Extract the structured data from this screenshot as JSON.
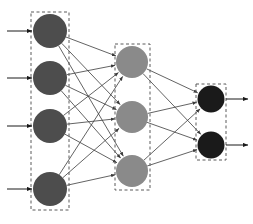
{
  "diagram": {
    "type": "neural-network",
    "canvas": {
      "width": 253,
      "height": 224,
      "background": "#ffffff"
    },
    "edge_color": "#3b3b3b",
    "edge_width": 0.8,
    "arrow_color": "#1a1a1a",
    "group_box_style": {
      "stroke": "#5a5a5a",
      "stroke_width": 1,
      "dash": "3,2.5",
      "fill": "none"
    },
    "node_stroke": "none",
    "layers": [
      {
        "id": "input-layer",
        "name": "Input Layer",
        "node_count": 4,
        "node_color": "#4d4d4d",
        "node_radius": 17,
        "center_x": 50,
        "box": {
          "x": 31,
          "y": 12,
          "width": 38,
          "height": 198
        },
        "nodes": [
          {
            "id": "input-node-1",
            "cx": 50,
            "cy": 31
          },
          {
            "id": "input-node-2",
            "cx": 50,
            "cy": 78
          },
          {
            "id": "input-node-3",
            "cx": 50,
            "cy": 126
          },
          {
            "id": "input-node-4",
            "cx": 50,
            "cy": 189
          }
        ],
        "io_arrows": [
          {
            "id": "input-arrow-1",
            "x1": 7,
            "y1": 31,
            "x2": 32,
            "y2": 31
          },
          {
            "id": "input-arrow-2",
            "x1": 7,
            "y1": 78,
            "x2": 32,
            "y2": 78
          },
          {
            "id": "input-arrow-3",
            "x1": 7,
            "y1": 126,
            "x2": 32,
            "y2": 126
          },
          {
            "id": "input-arrow-4",
            "x1": 7,
            "y1": 189,
            "x2": 32,
            "y2": 189
          }
        ]
      },
      {
        "id": "hidden-layer",
        "name": "Hidden Layer",
        "node_count": 3,
        "node_color": "#8a8a8a",
        "node_radius": 16,
        "center_x": 132,
        "box": {
          "x": 115,
          "y": 44,
          "width": 35,
          "height": 146
        },
        "nodes": [
          {
            "id": "hidden-node-1",
            "cx": 132,
            "cy": 62
          },
          {
            "id": "hidden-node-2",
            "cx": 132,
            "cy": 117
          },
          {
            "id": "hidden-node-3",
            "cx": 132,
            "cy": 171
          }
        ],
        "io_arrows": []
      },
      {
        "id": "output-layer",
        "name": "Output Layer",
        "node_count": 2,
        "node_color": "#1a1a1a",
        "node_radius": 13.5,
        "center_x": 211,
        "box": {
          "x": 196,
          "y": 84,
          "width": 30,
          "height": 76
        },
        "nodes": [
          {
            "id": "output-node-1",
            "cx": 211,
            "cy": 99
          },
          {
            "id": "output-node-2",
            "cx": 211,
            "cy": 145
          }
        ],
        "io_arrows": [
          {
            "id": "output-arrow-1",
            "x1": 226,
            "y1": 99,
            "x2": 248,
            "y2": 99
          },
          {
            "id": "output-arrow-2",
            "x1": 226,
            "y1": 145,
            "x2": 248,
            "y2": 145
          }
        ]
      }
    ],
    "connections": [
      {
        "from": "input-node-1",
        "to": "hidden-node-1"
      },
      {
        "from": "input-node-1",
        "to": "hidden-node-2"
      },
      {
        "from": "input-node-1",
        "to": "hidden-node-3"
      },
      {
        "from": "input-node-2",
        "to": "hidden-node-1"
      },
      {
        "from": "input-node-2",
        "to": "hidden-node-2"
      },
      {
        "from": "input-node-2",
        "to": "hidden-node-3"
      },
      {
        "from": "input-node-3",
        "to": "hidden-node-1"
      },
      {
        "from": "input-node-3",
        "to": "hidden-node-2"
      },
      {
        "from": "input-node-3",
        "to": "hidden-node-3"
      },
      {
        "from": "input-node-4",
        "to": "hidden-node-1"
      },
      {
        "from": "input-node-4",
        "to": "hidden-node-2"
      },
      {
        "from": "input-node-4",
        "to": "hidden-node-3"
      },
      {
        "from": "hidden-node-1",
        "to": "output-node-1"
      },
      {
        "from": "hidden-node-1",
        "to": "output-node-2"
      },
      {
        "from": "hidden-node-2",
        "to": "output-node-1"
      },
      {
        "from": "hidden-node-2",
        "to": "output-node-2"
      },
      {
        "from": "hidden-node-3",
        "to": "output-node-1"
      },
      {
        "from": "hidden-node-3",
        "to": "output-node-2"
      }
    ]
  }
}
